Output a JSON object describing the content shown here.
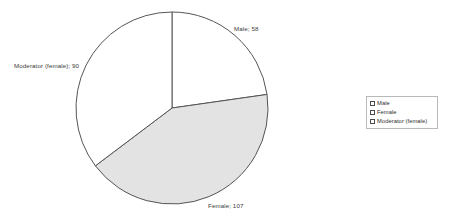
{
  "chart_data": {
    "type": "pie",
    "title": "",
    "subtitle": "",
    "xlabel": "",
    "ylabel": "",
    "grid": false,
    "legend_position": "right",
    "total": 255,
    "start_angle_deg": 0,
    "direction": "clockwise",
    "categories": [
      "Male",
      "Female",
      "Moderator (female)"
    ],
    "values": [
      58,
      107,
      90
    ],
    "slices": [
      {
        "label": "Male",
        "value": 58,
        "sweep_deg": 81.9,
        "color": "#ffffff",
        "stroke": "#555555",
        "data_label": "Male; 58"
      },
      {
        "label": "Female",
        "value": 107,
        "sweep_deg": 151.1,
        "color": "#e3e3e3",
        "stroke": "#555555",
        "data_label": "Female; 107"
      },
      {
        "label": "Moderator (female)",
        "value": 90,
        "sweep_deg": 127.1,
        "color": "#ffffff",
        "stroke": "#555555",
        "data_label": "Moderator (female); 90"
      }
    ],
    "annotations": [
      "Male; 58",
      "Female; 107",
      "Moderator (female); 90"
    ]
  },
  "labels": {
    "male": "Male; 58",
    "female": "Female; 107",
    "moderator": "Moderator (female); 90"
  },
  "legend": {
    "items": [
      {
        "label": "Male",
        "swatch_color": "#ffffff"
      },
      {
        "label": "Female",
        "swatch_color": "#ffffff"
      },
      {
        "label": "Moderator (female)",
        "swatch_color": "#ffffff"
      }
    ]
  },
  "colors": {
    "background": "#ffffff",
    "outline": "#555555",
    "female_fill": "#e3e3e3",
    "other_fill": "#ffffff",
    "legend_border": "#b9b9b9",
    "text": "#2e2e2e"
  }
}
